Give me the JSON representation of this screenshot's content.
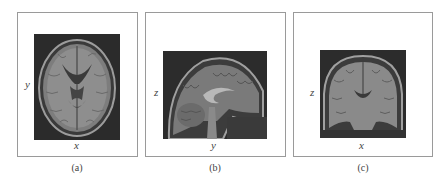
{
  "figure": {
    "panels": [
      {
        "id": "a",
        "view": "axial",
        "vertical_axis": "y",
        "horizontal_axis": "x",
        "caption": "(a)"
      },
      {
        "id": "b",
        "view": "sagittal",
        "vertical_axis": "z",
        "horizontal_axis": "y",
        "caption": "(b)"
      },
      {
        "id": "c",
        "view": "coronal",
        "vertical_axis": "z",
        "horizontal_axis": "x",
        "caption": "(c)"
      }
    ]
  }
}
